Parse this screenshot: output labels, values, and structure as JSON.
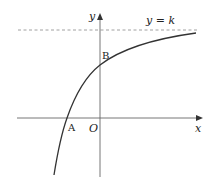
{
  "diagram": {
    "axes": {
      "x_label": "x",
      "y_label": "y",
      "origin_label": "O"
    },
    "asymptote": {
      "label": "y = k",
      "style": "dashed"
    },
    "points": [
      {
        "name": "A",
        "description": "x-intercept of curve (negative x)"
      },
      {
        "name": "B",
        "description": "y-intercept of curve (positive y)"
      }
    ],
    "colors": {
      "curve": "#333333",
      "axes": "#666666",
      "asymptote": "#888888"
    }
  }
}
